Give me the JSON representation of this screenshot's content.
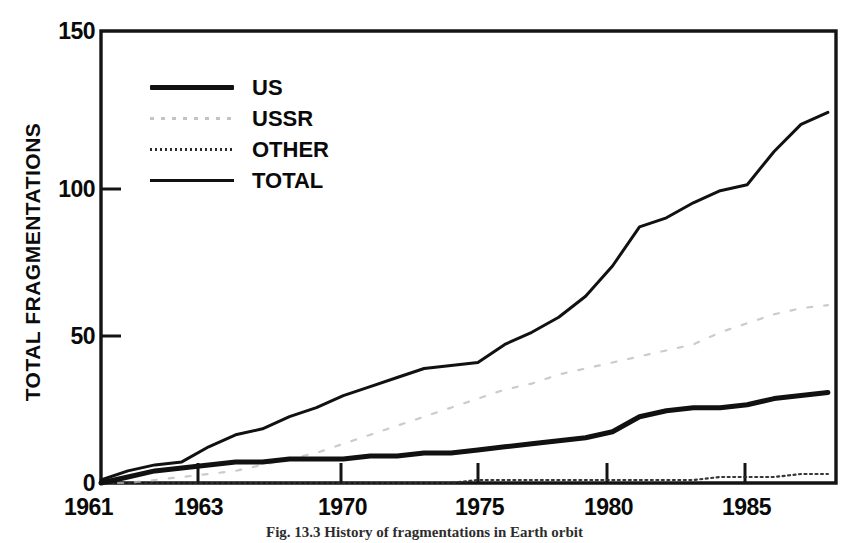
{
  "figure": {
    "caption": "Fig. 13.3   History of fragmentations in Earth orbit",
    "ylabel": "TOTAL FRAGMENTATIONS"
  },
  "legend": {
    "position": "upper-left-inside",
    "entries": [
      {
        "label": "US",
        "style": "thick-solid",
        "color": "#111111"
      },
      {
        "label": "USSR",
        "style": "faint-dashed",
        "color": "#b9b9b9"
      },
      {
        "label": "OTHER",
        "style": "dotted",
        "color": "#2b2b2b"
      },
      {
        "label": "TOTAL",
        "style": "thin-solid",
        "color": "#111111"
      }
    ]
  },
  "axes": {
    "y_ticks": [
      "0",
      "50",
      "100",
      "150"
    ],
    "x_ticks": [
      "1961",
      "1963",
      "1970",
      "1975",
      "1980",
      "1985"
    ]
  },
  "chart_data": {
    "type": "line",
    "title": "",
    "xlabel": "",
    "ylabel": "TOTAL FRAGMENTATIONS",
    "xlim": [
      1961,
      1988.3
    ],
    "ylim": [
      0,
      150
    ],
    "grid": false,
    "legend_position": "upper-left-inside",
    "x": [
      1961,
      1962,
      1963,
      1964,
      1965,
      1966,
      1967,
      1968,
      1969,
      1970,
      1971,
      1972,
      1973,
      1974,
      1975,
      1976,
      1977,
      1978,
      1979,
      1980,
      1981,
      1982,
      1983,
      1984,
      1985,
      1986,
      1987,
      1988
    ],
    "series": [
      {
        "name": "US",
        "style": "thick-solid",
        "color": "#111111",
        "values": [
          0,
          2,
          4,
          5,
          6,
          7,
          7,
          8,
          8,
          8,
          9,
          9,
          10,
          10,
          11,
          12,
          13,
          14,
          15,
          17,
          22,
          24,
          25,
          25,
          26,
          28,
          29,
          30
        ]
      },
      {
        "name": "USSR",
        "style": "faint-dashed",
        "color": "#b9b9b9",
        "values": [
          0,
          0,
          1,
          2,
          3,
          4,
          6,
          8,
          10,
          13,
          16,
          19,
          22,
          25,
          28,
          31,
          33,
          36,
          38,
          40,
          42,
          44,
          46,
          50,
          53,
          56,
          58,
          59
        ]
      },
      {
        "name": "OTHER",
        "style": "dotted",
        "color": "#2b2b2b",
        "values": [
          0,
          0,
          0,
          0,
          0,
          0,
          0,
          0,
          0,
          0,
          0,
          0,
          0,
          0,
          1,
          1,
          1,
          1,
          1,
          1,
          1,
          1,
          1,
          2,
          2,
          2,
          3,
          3
        ]
      },
      {
        "name": "TOTAL",
        "style": "thin-solid",
        "color": "#111111",
        "values": [
          1,
          4,
          6,
          7,
          12,
          16,
          18,
          22,
          25,
          29,
          32,
          35,
          38,
          39,
          40,
          46,
          50,
          55,
          62,
          72,
          85,
          88,
          93,
          97,
          99,
          110,
          119,
          123
        ]
      }
    ]
  }
}
